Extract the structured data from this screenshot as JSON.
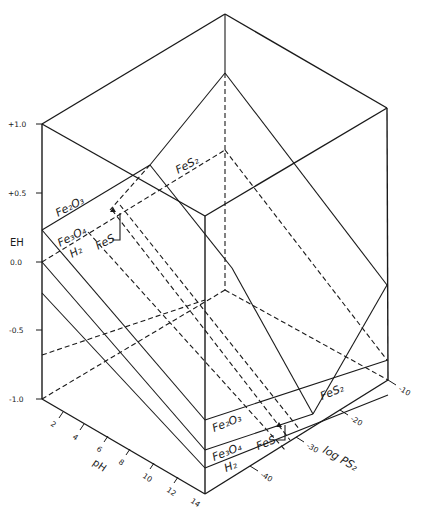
{
  "figure": {
    "type": "3D Eh-pH-log PS2 stability diagram (iron oxides/sulfides)",
    "colors": {
      "ink": "#1a1a1a",
      "background": "#ffffff"
    }
  },
  "axes": {
    "eh": {
      "label": "EH",
      "ticks": [
        "+1.0",
        "+0.5",
        "0.0",
        "-0.5",
        "-1.0"
      ]
    },
    "ph": {
      "label": "pH",
      "ticks": [
        "2",
        "4",
        "6",
        "8",
        "10",
        "12",
        "14"
      ]
    },
    "log_ps2": {
      "label": "log PS2",
      "ticks": [
        "-10",
        "-20",
        "-30",
        "-40"
      ]
    }
  },
  "phases": {
    "left_face": [
      "Fe2O3",
      "Fe3O4",
      "H2",
      "FeS",
      "FeS2"
    ],
    "front_face": [
      "Fe2O3",
      "Fe3O4",
      "H2",
      "FeS",
      "FeS2"
    ]
  },
  "labels": {
    "fe2o3_back": "Fe₂O₃",
    "fe3o4_back": "Fe₃O₄",
    "h2_back": "H₂",
    "fes_back": "FeS",
    "fes2_back": "FeS₂",
    "fe2o3_front": "Fe₂O₃",
    "fe3o4_front": "Fe₃O₄",
    "h2_front": "H₂",
    "fes_front": "FeS",
    "fes2_front": "FeS₂",
    "eh_axis": "EH",
    "ph_axis": "pH",
    "ps2_axis": "log PS₂",
    "eh_p10": "+1.0",
    "eh_p05": "+0.5",
    "eh_00": "0.0",
    "eh_m05": "-0.5",
    "eh_m10": "-1.0",
    "ph_2": "2",
    "ph_4": "4",
    "ph_6": "6",
    "ph_8": "8",
    "ph_10": "10",
    "ph_12": "12",
    "ph_14": "14",
    "ps_m10": "-10",
    "ps_m20": "-20",
    "ps_m30": "-30",
    "ps_m40": "-40"
  }
}
